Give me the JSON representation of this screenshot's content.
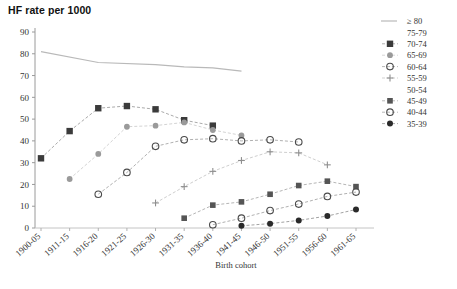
{
  "chart_data": {
    "type": "scatter",
    "title": "HF rate per 1000",
    "xlabel": "Birth cohort",
    "ylabel": "",
    "ylim": [
      0,
      90
    ],
    "ytick_step": 10,
    "yticks": [
      0,
      10,
      20,
      30,
      40,
      50,
      60,
      70,
      80,
      90
    ],
    "grid": false,
    "legend_position": "right",
    "categories": [
      "1900-05",
      "1911-15",
      "1916-20",
      "1921-25",
      "1926-30",
      "1931-35",
      "1936-40",
      "1941-45",
      "1946-50",
      "1951-55",
      "1956-60",
      "1961-65"
    ],
    "series": [
      {
        "name": "≥ 80",
        "marker": "line",
        "color": "#b9b9b9",
        "values": [
          81,
          null,
          76,
          null,
          75,
          74,
          73.5,
          72,
          null,
          null,
          null,
          null
        ]
      },
      {
        "name": "75-79",
        "marker": "none",
        "color": "#c8c8c8",
        "values": [
          null,
          null,
          null,
          null,
          null,
          null,
          null,
          null,
          null,
          null,
          null,
          null
        ]
      },
      {
        "name": "70-74",
        "marker": "square-dark",
        "color": "#3b3b3b",
        "values": [
          32,
          44.5,
          55,
          56,
          54.5,
          49.5,
          47,
          null,
          null,
          null,
          null,
          null
        ]
      },
      {
        "name": "65-69",
        "marker": "circle-gray",
        "color": "#9a9a9a",
        "values": [
          null,
          22.5,
          34,
          46.5,
          47,
          48.5,
          45,
          42.5,
          null,
          null,
          null,
          null
        ]
      },
      {
        "name": "60-64",
        "marker": "circle-open",
        "color": "#4a4a4a",
        "values": [
          null,
          null,
          15.5,
          25.5,
          37.5,
          40.5,
          41,
          40,
          40.5,
          39.5,
          null,
          null
        ]
      },
      {
        "name": "55-59",
        "marker": "plus",
        "color": "#8f8f8f",
        "values": [
          null,
          null,
          null,
          null,
          11.5,
          19,
          26,
          31,
          35,
          34.5,
          29,
          null
        ]
      },
      {
        "name": "50-54",
        "marker": "none",
        "color": "#c8c8c8",
        "values": [
          null,
          null,
          null,
          null,
          null,
          null,
          null,
          null,
          null,
          null,
          null,
          null
        ]
      },
      {
        "name": "45-49",
        "marker": "square-mid",
        "color": "#555555",
        "values": [
          null,
          null,
          null,
          null,
          null,
          4.5,
          10.5,
          12,
          15.5,
          19.5,
          21.5,
          19
        ]
      },
      {
        "name": "40-44",
        "marker": "circle-open",
        "color": "#4a4a4a",
        "values": [
          null,
          null,
          null,
          null,
          null,
          null,
          1.5,
          4.5,
          8,
          11,
          14.5,
          16.5
        ]
      },
      {
        "name": "35-39",
        "marker": "circle-filled",
        "color": "#2a2a2a",
        "values": [
          null,
          null,
          null,
          null,
          null,
          null,
          null,
          1,
          2,
          3.5,
          5.5,
          8.5
        ]
      }
    ]
  }
}
